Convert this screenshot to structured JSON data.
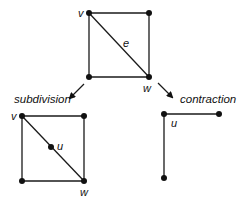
{
  "diagram": {
    "original": {
      "vertices": [
        {
          "id": "v",
          "x": 89,
          "y": 13,
          "label": "v"
        },
        {
          "id": "tr",
          "x": 149,
          "y": 13,
          "label": ""
        },
        {
          "id": "bl",
          "x": 89,
          "y": 77,
          "label": ""
        },
        {
          "id": "w",
          "x": 149,
          "y": 77,
          "label": "w"
        }
      ],
      "edge_label": "e"
    },
    "operations": {
      "left": "subdivision",
      "right": "contraction"
    },
    "subdivided": {
      "vertices": [
        {
          "id": "v",
          "label": "v"
        },
        {
          "id": "tr",
          "label": ""
        },
        {
          "id": "bl",
          "label": ""
        },
        {
          "id": "w",
          "label": "w"
        },
        {
          "id": "u",
          "label": "u"
        }
      ]
    },
    "contracted": {
      "vertices": [
        {
          "id": "u",
          "label": "u"
        },
        {
          "id": "right",
          "label": ""
        },
        {
          "id": "bottom",
          "label": ""
        }
      ]
    },
    "colors": {
      "ink": "#111111",
      "background": "#ffffff"
    }
  }
}
